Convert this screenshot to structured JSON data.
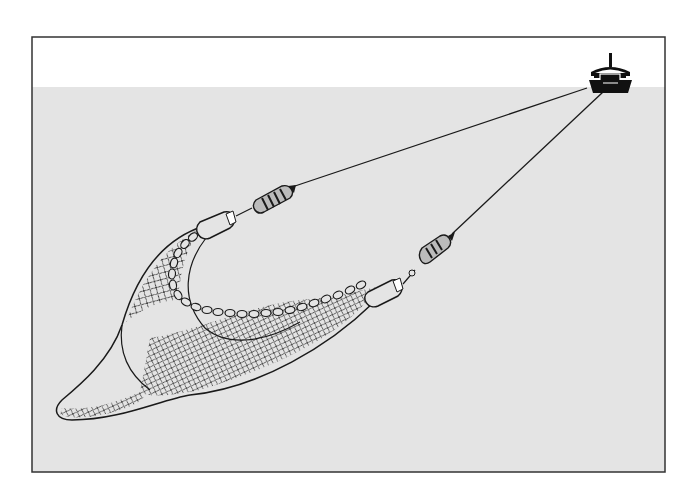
{
  "diagram": {
    "colors": {
      "background": "#ffffff",
      "frame": "#333333",
      "water": "#e4e4e4",
      "line": "#1a1a1a",
      "boat": "#111111"
    },
    "elements": [
      {
        "name": "fishing-boat",
        "label": "Boat"
      },
      {
        "name": "tow-line-left",
        "label": "Warp line"
      },
      {
        "name": "tow-line-right",
        "label": "Warp line"
      },
      {
        "name": "float-left",
        "label": "Float"
      },
      {
        "name": "float-right",
        "label": "Float"
      },
      {
        "name": "otter-board-left",
        "label": "Wing end"
      },
      {
        "name": "otter-board-right",
        "label": "Wing end"
      },
      {
        "name": "float-line",
        "label": "Headrope with floats"
      },
      {
        "name": "net-body",
        "label": "Net"
      },
      {
        "name": "cod-end",
        "label": "Cod end"
      }
    ]
  }
}
